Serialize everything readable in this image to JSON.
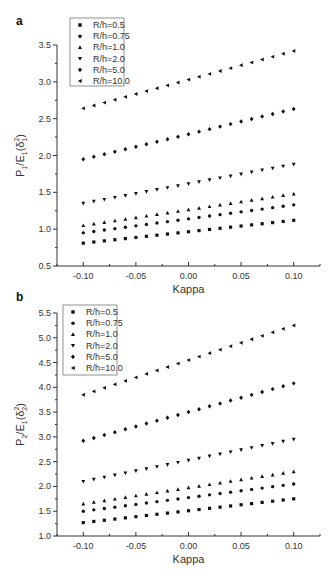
{
  "chart_data": [
    {
      "panel": "a",
      "type": "scatter",
      "title": "",
      "xlabel": "Kappa",
      "ylabel": "P1/E1(δ1²)",
      "ylabel_parts": {
        "main": "P",
        "sub1": "1",
        "mid": "/E",
        "sub2": "1",
        "paren_open": "(δ",
        "sup": "2",
        "sub3": "1",
        "paren_close": ")"
      },
      "xlim": [
        -0.125,
        0.125
      ],
      "ylim": [
        0.5,
        3.5
      ],
      "xticks": [
        "-0.10",
        "-0.05",
        "0.00",
        "0.05",
        "0.10"
      ],
      "yticks": [
        "0.5",
        "1.0",
        "1.5",
        "2.0",
        "2.5",
        "3.0",
        "3.5"
      ],
      "grid": false,
      "legend_position": "upper-left",
      "x": [
        -0.1,
        -0.09,
        -0.08,
        -0.07,
        -0.06,
        -0.05,
        -0.04,
        -0.03,
        -0.02,
        -0.01,
        0.0,
        0.01,
        0.02,
        0.03,
        0.04,
        0.05,
        0.06,
        0.07,
        0.08,
        0.09,
        0.1
      ],
      "series": [
        {
          "name": "R/h=0.5",
          "marker": "square",
          "start": 0.81,
          "end": 1.12
        },
        {
          "name": "R/h=0.75",
          "marker": "circle",
          "start": 0.95,
          "end": 1.33
        },
        {
          "name": "R/h=1.0",
          "marker": "triangle-up",
          "start": 1.05,
          "end": 1.48
        },
        {
          "name": "R/h=2.0",
          "marker": "triangle-down",
          "start": 1.35,
          "end": 1.88
        },
        {
          "name": "R/h=5.0",
          "marker": "diamond",
          "start": 1.95,
          "end": 2.63
        },
        {
          "name": "R/h=10.0",
          "marker": "triangle-left",
          "start": 2.64,
          "end": 3.42
        }
      ]
    },
    {
      "panel": "b",
      "type": "scatter",
      "title": "",
      "xlabel": "Kappa",
      "ylabel": "P2/E1(δ2²)",
      "ylabel_parts": {
        "main": "P",
        "sub1": "2",
        "mid": "/E",
        "sub2": "1",
        "paren_open": "(δ",
        "sup": "2",
        "sub3": "2",
        "paren_close": ")"
      },
      "xlim": [
        -0.125,
        0.125
      ],
      "ylim": [
        1.0,
        5.5
      ],
      "xticks": [
        "-0.10",
        "-0.05",
        "0.00",
        "0.05",
        "0.10"
      ],
      "yticks": [
        "1.0",
        "1.5",
        "2.0",
        "2.5",
        "3.0",
        "3.5",
        "4.0",
        "4.5",
        "5.0",
        "5.5"
      ],
      "grid": false,
      "legend_position": "upper-left",
      "x": [
        -0.1,
        -0.09,
        -0.08,
        -0.07,
        -0.06,
        -0.05,
        -0.04,
        -0.03,
        -0.02,
        -0.01,
        0.0,
        0.01,
        0.02,
        0.03,
        0.04,
        0.05,
        0.06,
        0.07,
        0.08,
        0.09,
        0.1
      ],
      "series": [
        {
          "name": "R/h=0.5",
          "marker": "square",
          "start": 1.27,
          "end": 1.75
        },
        {
          "name": "R/h=0.75",
          "marker": "circle",
          "start": 1.5,
          "end": 2.05
        },
        {
          "name": "R/h=1.0",
          "marker": "triangle-up",
          "start": 1.65,
          "end": 2.3
        },
        {
          "name": "R/h=2.0",
          "marker": "triangle-down",
          "start": 2.1,
          "end": 2.95
        },
        {
          "name": "R/h=5.0",
          "marker": "diamond",
          "start": 2.92,
          "end": 4.08
        },
        {
          "name": "R/h=10.0",
          "marker": "triangle-left",
          "start": 3.85,
          "end": 5.25
        }
      ]
    }
  ],
  "panels": {
    "a": {
      "letter": "a"
    },
    "b": {
      "letter": "b"
    }
  }
}
